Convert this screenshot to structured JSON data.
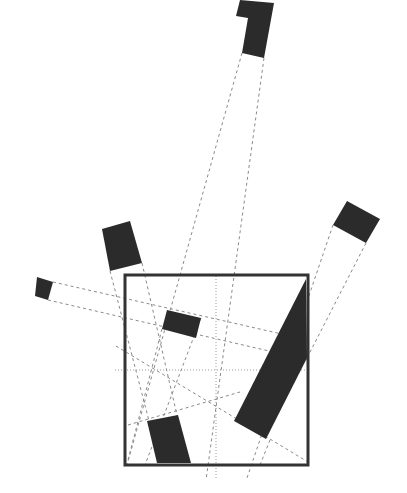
{
  "diagram": {
    "type": "projection-geometry",
    "colors": {
      "background": "#ffffff",
      "shape_fill": "#2b2b2b",
      "frame_stroke": "#333333",
      "dashed_line": "#8a8a8a",
      "dotted_line": "#9a9a9a"
    },
    "frame": {
      "x": 125,
      "y": 275,
      "width": 183,
      "height": 190
    },
    "crosshair": {
      "vertical": {
        "x1": 216,
        "y1": 276,
        "x2": 216,
        "y2": 480
      },
      "horizontal": {
        "x1": 115,
        "y1": 370,
        "x2": 308,
        "y2": 370
      }
    },
    "shapes": [
      {
        "id": "top-block",
        "points": "240,0 274,3 264,58 242,53 248,18 236,16"
      },
      {
        "id": "right-block",
        "points": "347,201 380,219 366,243 333,225"
      },
      {
        "id": "upper-left-block",
        "points": "102,229 130,221 142,263 110,271"
      },
      {
        "id": "small-left-block",
        "points": "37,277 53,282 48,300 35,296"
      },
      {
        "id": "middle-block",
        "points": "167,310 201,318 196,338 162,329"
      },
      {
        "id": "bottom-block",
        "points": "147,421 178,415 191,463 157,463"
      },
      {
        "id": "large-diagonal-block",
        "points": "306,279 307,358 266,439 234,421"
      }
    ],
    "dashed_lines": [
      {
        "x1": 242,
        "y1": 53,
        "x2": 127,
        "y2": 465
      },
      {
        "x1": 264,
        "y1": 58,
        "x2": 206,
        "y2": 480
      },
      {
        "x1": 110,
        "y1": 271,
        "x2": 160,
        "y2": 463
      },
      {
        "x1": 142,
        "y1": 263,
        "x2": 188,
        "y2": 463
      },
      {
        "x1": 53,
        "y1": 282,
        "x2": 308,
        "y2": 340
      },
      {
        "x1": 48,
        "y1": 300,
        "x2": 308,
        "y2": 360
      },
      {
        "x1": 333,
        "y1": 225,
        "x2": 247,
        "y2": 478
      },
      {
        "x1": 366,
        "y1": 243,
        "x2": 306,
        "y2": 360
      },
      {
        "x1": 270,
        "y1": 440,
        "x2": 260,
        "y2": 465
      },
      {
        "x1": 116,
        "y1": 346,
        "x2": 308,
        "y2": 462
      },
      {
        "x1": 128,
        "y1": 425,
        "x2": 240,
        "y2": 392
      },
      {
        "x1": 162,
        "y1": 329,
        "x2": 128,
        "y2": 460
      },
      {
        "x1": 201,
        "y1": 318,
        "x2": 145,
        "y2": 465
      }
    ]
  }
}
